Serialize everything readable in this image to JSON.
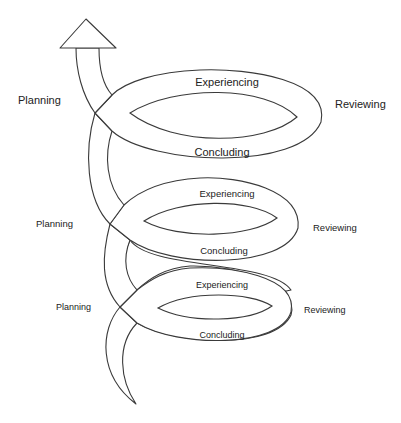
{
  "diagram": {
    "type": "spiral-cycle",
    "direction": "upward",
    "colors": {
      "stroke": "#3a3a3a",
      "fill": "#ffffff",
      "text": "#222222",
      "background": "#ffffff"
    },
    "cycles": [
      {
        "level": "top",
        "planning": "Planning",
        "experiencing": "Experiencing",
        "reviewing": "Reviewing",
        "concluding": "Concluding"
      },
      {
        "level": "middle",
        "planning": "Planning",
        "experiencing": "Experiencing",
        "reviewing": "Reviewing",
        "concluding": "Concluding"
      },
      {
        "level": "bottom",
        "planning": "Planning",
        "experiencing": "Experiencing",
        "reviewing": "Reviewing",
        "concluding": "Concluding"
      }
    ],
    "arrowhead": "up-arrow-icon"
  }
}
